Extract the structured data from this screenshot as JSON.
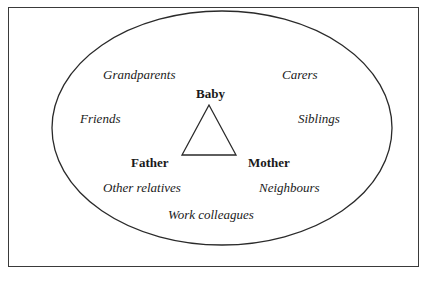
{
  "diagram": {
    "type": "ecological-relationship-diagram",
    "core": {
      "shape": "triangle",
      "nodes": [
        {
          "id": "baby",
          "label": "Baby",
          "style": "bold"
        },
        {
          "id": "father",
          "label": "Father",
          "style": "bold"
        },
        {
          "id": "mother",
          "label": "Mother",
          "style": "bold"
        }
      ]
    },
    "outer_ring": {
      "shape": "ellipse",
      "labels": [
        {
          "id": "grandparents",
          "label": "Grandparents",
          "style": "italic"
        },
        {
          "id": "carers",
          "label": "Carers",
          "style": "italic"
        },
        {
          "id": "friends",
          "label": "Friends",
          "style": "italic"
        },
        {
          "id": "siblings",
          "label": "Siblings",
          "style": "italic"
        },
        {
          "id": "other-relatives",
          "label": "Other relatives",
          "style": "italic"
        },
        {
          "id": "neighbours",
          "label": "Neighbours",
          "style": "italic"
        },
        {
          "id": "work-colleagues",
          "label": "Work colleagues",
          "style": "italic"
        }
      ]
    },
    "colors": {
      "stroke": "#2a2a2a",
      "text": "#1a1a1a",
      "background": "#ffffff"
    }
  },
  "labels": {
    "baby": "Baby",
    "father": "Father",
    "mother": "Mother",
    "grandparents": "Grandparents",
    "carers": "Carers",
    "friends": "Friends",
    "siblings": "Siblings",
    "other_relatives": "Other relatives",
    "neighbours": "Neighbours",
    "work_colleagues": "Work colleagues"
  }
}
